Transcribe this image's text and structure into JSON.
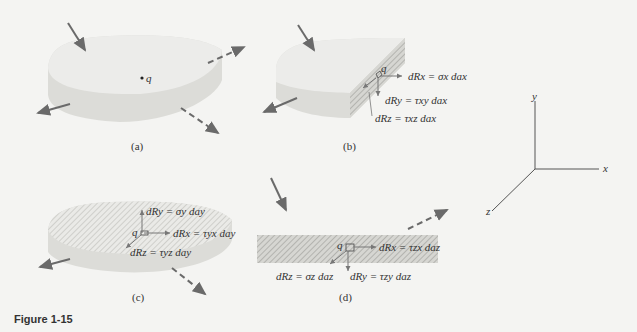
{
  "figure": {
    "caption": "Figure 1-15",
    "colors": {
      "background": "#f4f4f2",
      "body_top": "#ebebe8",
      "body_side": "#dcdcd8",
      "arrow": "#6a6a6a",
      "hatch": "#b8b8b4",
      "text": "#333333"
    }
  },
  "panels": {
    "a": {
      "label": "(a)",
      "point": "q"
    },
    "b": {
      "label": "(b)",
      "point": "q",
      "eq_x": "dRx = σx dax",
      "eq_y": "dRy = τxy dax",
      "eq_z": "dRz = τxz dax"
    },
    "c": {
      "label": "(c)",
      "point": "q",
      "eq_y": "dRy = σy day",
      "eq_x": "dRx = τyx day",
      "eq_z": "dRz = τyz day"
    },
    "d": {
      "label": "(d)",
      "point": "q",
      "eq_x": "dRx = τzx daz",
      "eq_z": "dRz = σz daz",
      "eq_y": "dRy = τzy daz"
    }
  },
  "axes": {
    "x": "x",
    "y": "y",
    "z": "z"
  }
}
